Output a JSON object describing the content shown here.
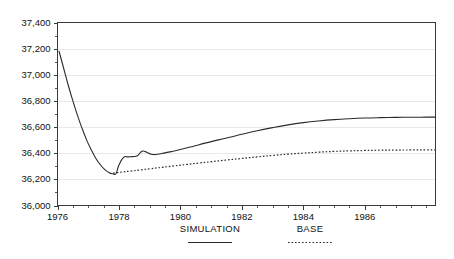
{
  "chart_data": {
    "type": "line",
    "title": "",
    "subtitle": "",
    "xlabel": "",
    "ylabel": "",
    "xlim": [
      1976.0,
      1988.3
    ],
    "ylim": [
      36000,
      37400
    ],
    "grid": true,
    "legend_position": "bottom",
    "y_ticks": [
      36000,
      36200,
      36400,
      36600,
      36800,
      37000,
      37200,
      37400
    ],
    "y_tick_labels": [
      "36,000",
      "36,200",
      "36,400",
      "36,600",
      "36,800",
      "37,000",
      "37,200",
      "37,400"
    ],
    "y_minor_tick_step": 100,
    "x_ticks": [
      1976,
      1978,
      1980,
      1982,
      1984,
      1986
    ],
    "x_tick_labels": [
      "1976",
      "1978",
      "1980",
      "1982",
      "1984",
      "1986"
    ],
    "x_minor_tick_step": 0.5,
    "series": [
      {
        "name": "SIMULATION",
        "style": "solid",
        "color": "#2b2b2b",
        "x": [
          1976.05,
          1976.2,
          1976.35,
          1976.5,
          1976.65,
          1976.8,
          1976.95,
          1977.1,
          1977.25,
          1977.4,
          1977.55,
          1977.7,
          1977.8,
          1977.9,
          1978.0,
          1978.15,
          1978.3,
          1978.45,
          1978.6,
          1978.75,
          1978.9,
          1979.05,
          1979.2,
          1979.4,
          1979.7,
          1980.0,
          1980.4,
          1980.8,
          1981.2,
          1981.6,
          1982.0,
          1982.5,
          1983.0,
          1983.5,
          1984.0,
          1984.5,
          1985.0,
          1985.5,
          1986.0,
          1986.5,
          1987.0,
          1987.5,
          1988.0,
          1988.3
        ],
        "y": [
          37180,
          37050,
          36920,
          36800,
          36690,
          36590,
          36500,
          36425,
          36360,
          36310,
          36272,
          36248,
          36243,
          36243,
          36310,
          36368,
          36372,
          36374,
          36380,
          36415,
          36408,
          36392,
          36390,
          36398,
          36412,
          36428,
          36452,
          36477,
          36500,
          36522,
          36545,
          36572,
          36596,
          36617,
          36634,
          36647,
          36657,
          36664,
          36669,
          36672,
          36674,
          36675,
          36676,
          36676
        ]
      },
      {
        "name": "BASE",
        "style": "dotted",
        "color": "#2b2b2b",
        "x": [
          1977.7,
          1977.9,
          1978.1,
          1978.4,
          1978.7,
          1979.0,
          1979.4,
          1979.8,
          1980.2,
          1980.6,
          1981.0,
          1981.5,
          1982.0,
          1982.5,
          1983.0,
          1983.5,
          1984.0,
          1984.5,
          1985.0,
          1985.5,
          1986.0,
          1986.5,
          1987.0,
          1987.5,
          1988.0,
          1988.3
        ],
        "y": [
          36246,
          36250,
          36256,
          36264,
          36272,
          36281,
          36292,
          36303,
          36314,
          36325,
          36335,
          36348,
          36360,
          36372,
          36383,
          36393,
          36401,
          36408,
          36414,
          36418,
          36421,
          36423,
          36424,
          36425,
          36426,
          36426
        ]
      }
    ],
    "legend": [
      {
        "label": "SIMULATION",
        "style": "solid"
      },
      {
        "label": "BASE",
        "style": "dotted"
      }
    ]
  }
}
